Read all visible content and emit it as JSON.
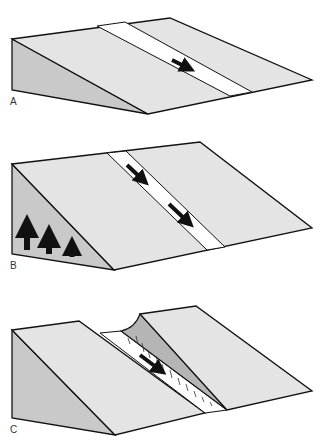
{
  "caption_fragment": "",
  "panels": [
    {
      "label": "A",
      "description": "Inclined slope with white fault stripe, single slip arrow"
    },
    {
      "label": "B",
      "description": "Uplifted slope with white fault stripe, two slip arrows, three uplift arrows on side face"
    },
    {
      "label": "C",
      "description": "Slope with scarp along fault stripe and slip arrow"
    }
  ],
  "colors": {
    "top_face": "#e4e4e4",
    "side_face": "#c9c9c9",
    "scarp": "#b5b5b5",
    "stripe": "#ffffff",
    "line": "#111111"
  }
}
